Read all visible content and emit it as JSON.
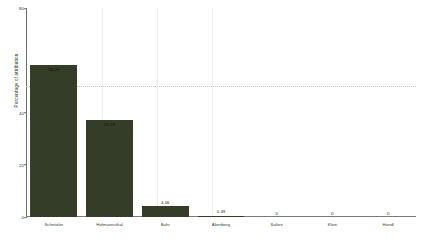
{
  "chart_data": {
    "type": "bar",
    "title": "",
    "xlabel": "",
    "ylabel": "Percentage of attribution",
    "ylim": [
      0,
      80
    ],
    "yticks": [
      0,
      20,
      40,
      80
    ],
    "ytick_labels": [
      "0",
      "20",
      "40",
      "80"
    ],
    "grid": false,
    "legend": null,
    "threshold_line": {
      "value": 50,
      "style": "dotted",
      "color": "#c9c9c9"
    },
    "bar_color": "#333d27",
    "categories": [
      "Schnitzler",
      "Hofmannsthal",
      "Bahr",
      "Altenberg",
      "Salten",
      "Klein",
      "Handl"
    ],
    "values": [
      58.26,
      37.19,
      4.06,
      0.49,
      0,
      0,
      0
    ],
    "value_labels": [
      "58.26",
      "37.19",
      "4.06",
      "0.49",
      "0",
      "0",
      "0"
    ]
  }
}
